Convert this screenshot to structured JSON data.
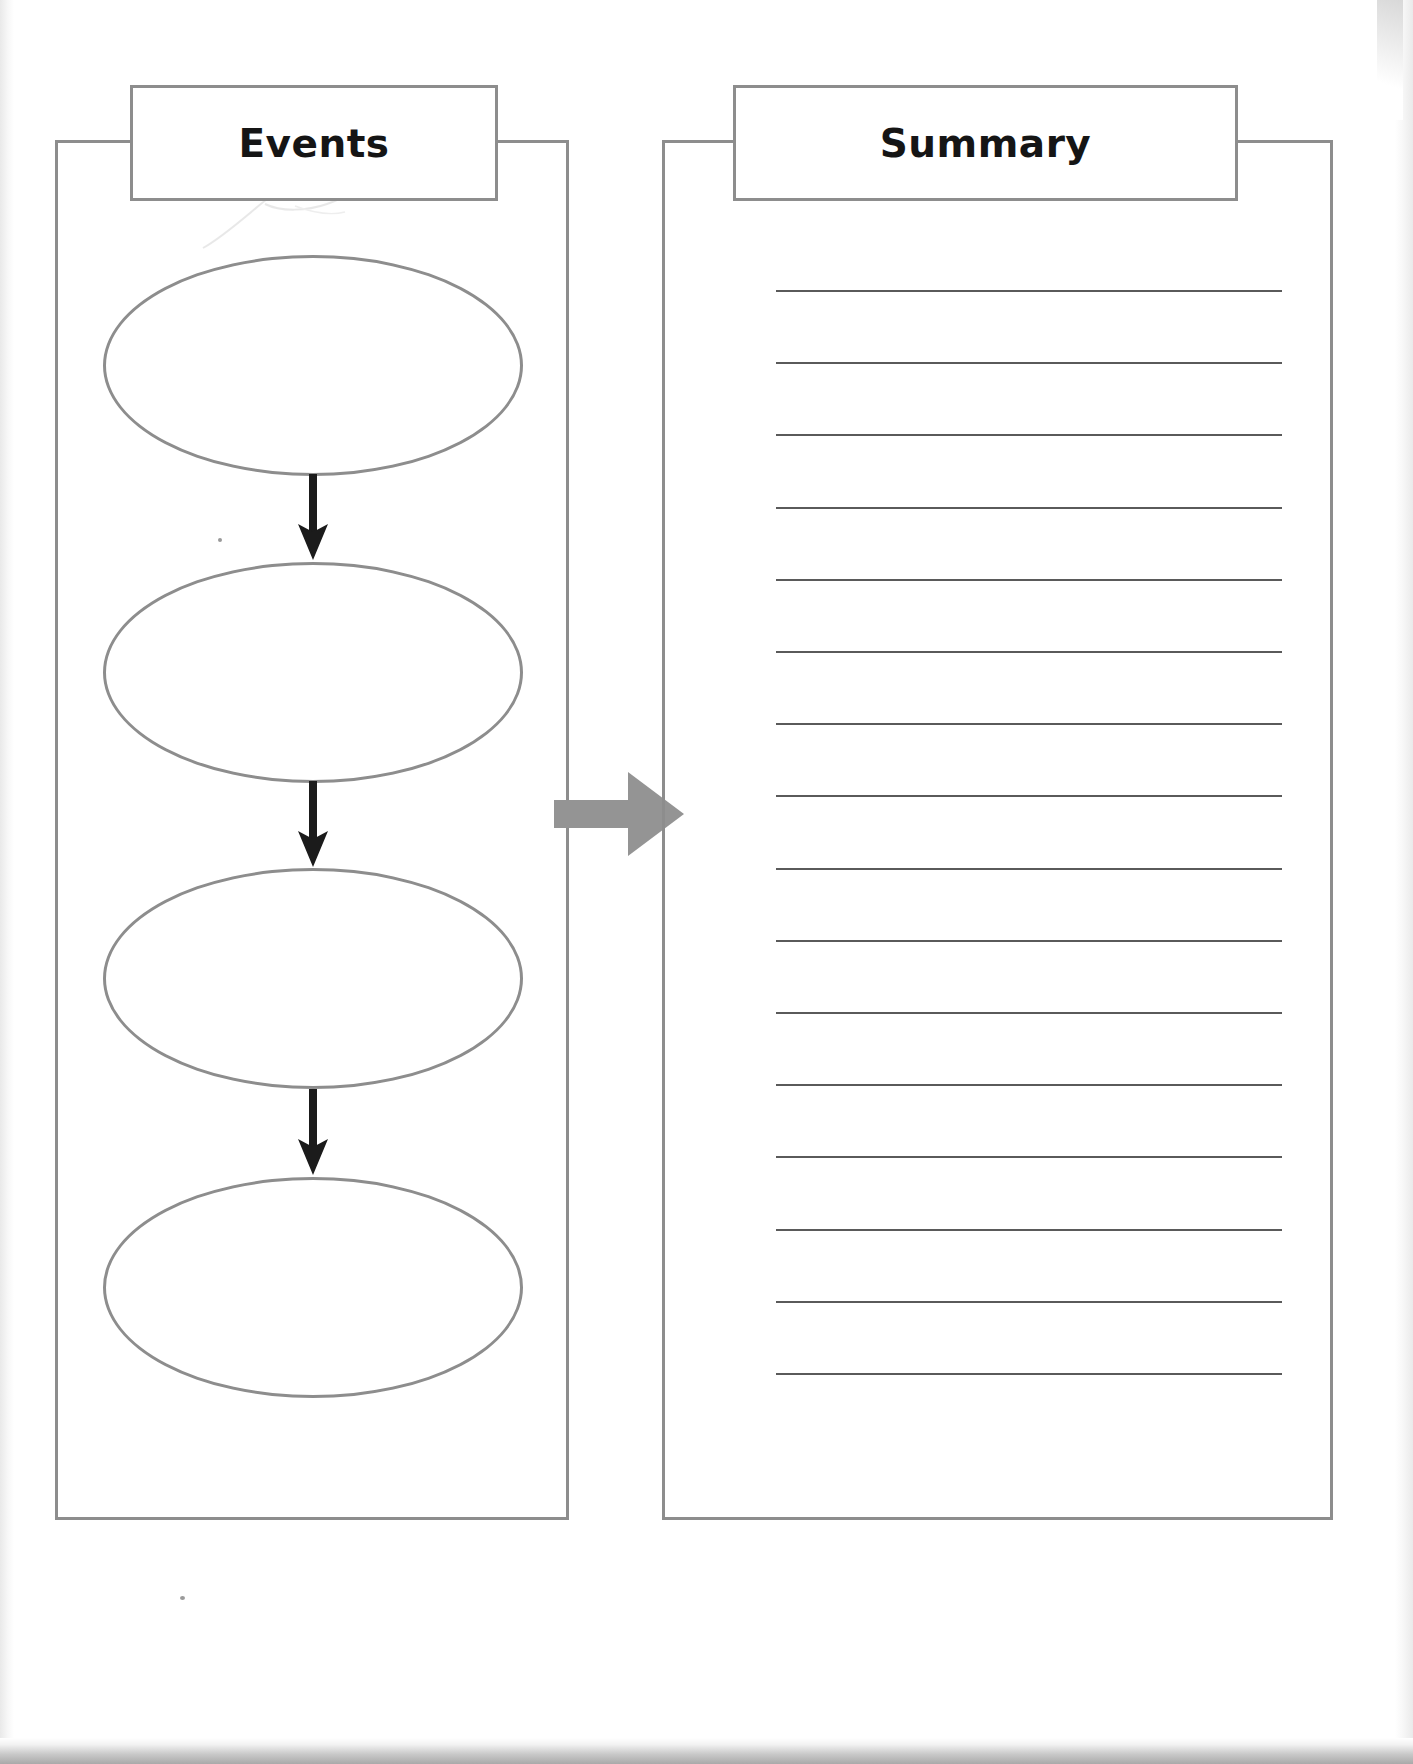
{
  "document": {
    "type": "graphic-organizer-worksheet",
    "orientation": "portrait"
  },
  "events_panel": {
    "title": "Events",
    "ellipse_count": 4,
    "ellipses": [
      {
        "label": "",
        "placeholder": ""
      },
      {
        "label": "",
        "placeholder": ""
      },
      {
        "label": "",
        "placeholder": ""
      },
      {
        "label": "",
        "placeholder": ""
      }
    ],
    "connector_icons": [
      "down-arrow-icon",
      "down-arrow-icon",
      "down-arrow-icon"
    ]
  },
  "transfer": {
    "icon": "right-block-arrow-icon",
    "color": "#949494"
  },
  "summary_panel": {
    "title": "Summary",
    "line_count": 16,
    "lines": [
      "",
      "",
      "",
      "",
      "",
      "",
      "",
      "",
      "",
      "",
      "",
      "",
      "",
      "",
      "",
      ""
    ]
  },
  "colors": {
    "border_gray": "#8d8d8d",
    "rule_gray": "#5a5a5a",
    "arrow_black": "#1b1b1b",
    "block_arrow_gray": "#949494",
    "page_white": "#ffffff",
    "title_black": "#151515"
  }
}
